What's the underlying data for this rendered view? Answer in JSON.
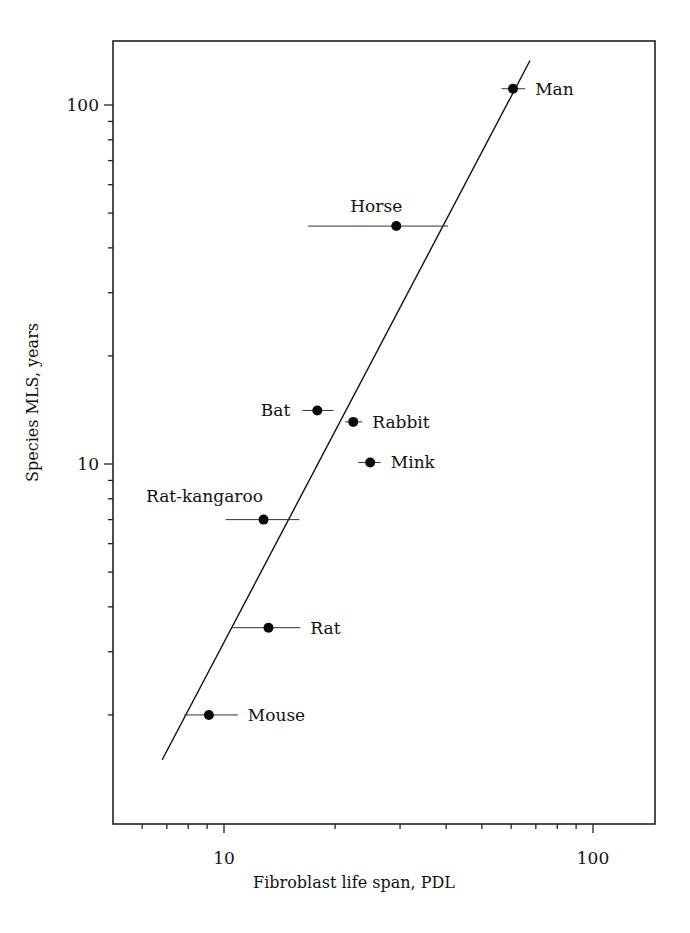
{
  "chart_data": {
    "type": "scatter",
    "title": "",
    "xlabel": "Fibroblast life span, PDL",
    "ylabel": "Species MLS, years",
    "xscale": "log",
    "yscale": "log",
    "xlim": [
      5.0,
      149
    ],
    "ylim": [
      1.0,
      152
    ],
    "x_major_ticks": [
      10,
      100
    ],
    "x_major_tick_labels": [
      "10",
      "100"
    ],
    "x_minor_ticks": [
      6,
      7,
      8,
      9,
      20,
      30,
      40,
      50,
      60,
      70,
      80,
      90
    ],
    "y_major_ticks": [
      10,
      100
    ],
    "y_major_tick_labels": [
      "10",
      "100"
    ],
    "y_minor_ticks": [
      2,
      3,
      4,
      5,
      6,
      7,
      8,
      9,
      20,
      30,
      40,
      50,
      60,
      70,
      80,
      90
    ],
    "grid": false,
    "legend": null,
    "points": [
      {
        "label": "Man",
        "x": 60.7,
        "y": 111,
        "xerr": [
          56.5,
          65.5
        ],
        "label_pos": "right"
      },
      {
        "label": "Horse",
        "x": 29.3,
        "y": 46,
        "xerr": [
          16.9,
          40.5
        ],
        "label_pos": "above"
      },
      {
        "label": "Bat",
        "x": 17.9,
        "y": 14.1,
        "xerr": [
          16.3,
          19.8
        ],
        "label_pos": "left"
      },
      {
        "label": "Rabbit",
        "x": 22.4,
        "y": 13.1,
        "xerr": [
          21.3,
          23.7
        ],
        "label_pos": "right"
      },
      {
        "label": "Mink",
        "x": 24.9,
        "y": 10.1,
        "xerr": [
          23.1,
          26.6
        ],
        "label_pos": "right"
      },
      {
        "label": "Rat-kangaroo",
        "x": 12.8,
        "y": 7.0,
        "xerr": [
          10.1,
          16.0
        ],
        "label_pos": "above-left"
      },
      {
        "label": "Rat",
        "x": 13.2,
        "y": 3.5,
        "xerr": [
          10.5,
          16.1
        ],
        "label_pos": "right"
      },
      {
        "label": "Mouse",
        "x": 9.1,
        "y": 2.0,
        "xerr": [
          7.8,
          10.9
        ],
        "label_pos": "right"
      }
    ],
    "fit_line": {
      "x": [
        6.8,
        67.5
      ],
      "y": [
        1.5,
        133
      ]
    }
  },
  "layout": {
    "plot": {
      "left": 113,
      "top": 41,
      "right": 655,
      "bottom": 824
    },
    "x_decade_px": 369,
    "x10_px": 224,
    "y_decade_px": 359,
    "y10_px": 464
  }
}
